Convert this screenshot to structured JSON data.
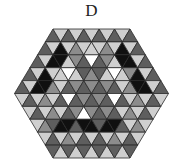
{
  "title": "D",
  "geometry": {
    "cx": 91.5,
    "top_y": 29,
    "side_units": 5,
    "tri_side": 15.4,
    "row_h": 12.9
  },
  "palette": {
    "W": "#ffffff",
    "L": "#cfcfcf",
    "G": "#8c8c8c",
    "DG": "#5e5e5e",
    "B": "#101010"
  },
  "rows": [
    [
      "DG",
      "L",
      "DG",
      "L",
      "DG",
      "L",
      "DG",
      "L",
      "DG",
      "L",
      "DG"
    ],
    [
      "DG",
      "L",
      "B",
      "L",
      "G",
      "L",
      "L",
      "L",
      "G",
      "L",
      "B",
      "L",
      "DG"
    ],
    [
      "DG",
      "L",
      "B",
      "B",
      "L",
      "G",
      "DG",
      "W",
      "DG",
      "G",
      "L",
      "B",
      "B",
      "L",
      "DG"
    ],
    [
      "DG",
      "L",
      "B",
      "L",
      "L",
      "W",
      "L",
      "DG",
      "G",
      "DG",
      "L",
      "W",
      "L",
      "G",
      "B",
      "L",
      "DG"
    ],
    [
      "DG",
      "L",
      "B",
      "B",
      "G",
      "L",
      "DG",
      "G",
      "DG",
      "G",
      "DG",
      "G",
      "DG",
      "L",
      "G",
      "B",
      "B",
      "L",
      "DG"
    ],
    [
      "L",
      "DG",
      "L",
      "G",
      "L",
      "DG",
      "W",
      "DG",
      "G",
      "DG",
      "G",
      "DG",
      "W",
      "DG",
      "L",
      "G",
      "L",
      "DG",
      "L"
    ],
    [
      "L",
      "DG",
      "L",
      "G",
      "L",
      "DG",
      "G",
      "W",
      "G",
      "DG",
      "G",
      "DG",
      "L",
      "G",
      "L",
      "DG",
      "L"
    ],
    [
      "L",
      "G",
      "DG",
      "B",
      "B",
      "DG",
      "B",
      "B",
      "DG",
      "B",
      "B",
      "DG",
      "L",
      "G",
      "L"
    ],
    [
      "L",
      "DG",
      "L",
      "G",
      "L",
      "DG",
      "L",
      "DG",
      "L",
      "G",
      "L",
      "DG",
      "L"
    ],
    [
      "DG",
      "L",
      "DG",
      "L",
      "DG",
      "L",
      "DG",
      "L",
      "DG",
      "L",
      "DG"
    ]
  ]
}
